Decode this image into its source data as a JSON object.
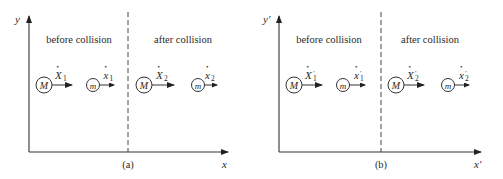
{
  "panels": [
    {
      "id": "a",
      "caption": "(a)",
      "x_axis_label": "x",
      "y_axis_label": "y",
      "region_before": "before collision",
      "region_after": "after collision",
      "bodies": [
        {
          "mass": "M",
          "velocity_symbol": "X",
          "subscript": "1",
          "prime": ""
        },
        {
          "mass": "m",
          "velocity_symbol": "x",
          "subscript": "1",
          "prime": ""
        },
        {
          "mass": "M",
          "velocity_symbol": "X",
          "subscript": "2",
          "prime": ""
        },
        {
          "mass": "m",
          "velocity_symbol": "x",
          "subscript": "2",
          "prime": ""
        }
      ]
    },
    {
      "id": "b",
      "caption": "(b)",
      "x_axis_label": "x′",
      "y_axis_label": "y′",
      "region_before": "before collision",
      "region_after": "after collision",
      "bodies": [
        {
          "mass": "M",
          "velocity_symbol": "X",
          "subscript": "1",
          "prime": "′"
        },
        {
          "mass": "m",
          "velocity_symbol": "x",
          "subscript": "1",
          "prime": "′"
        },
        {
          "mass": "M",
          "velocity_symbol": "X",
          "subscript": "2",
          "prime": "′"
        },
        {
          "mass": "m",
          "velocity_symbol": "x",
          "subscript": "2",
          "prime": "′"
        }
      ]
    }
  ],
  "dot": "•"
}
